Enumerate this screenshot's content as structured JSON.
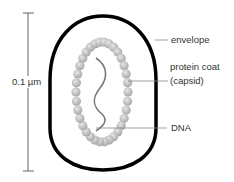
{
  "diagram": {
    "scale_bar": {
      "label": "0.1 µm"
    },
    "labels": {
      "envelope": "envelope",
      "protein_coat_line1": "protein coat",
      "protein_coat_line2": "(capsid)",
      "dna": "DNA"
    },
    "colors": {
      "envelope": "#000000",
      "capsid_bead": "#b8b8b8",
      "dna": "#777777",
      "leader_line": "#888888",
      "text": "#333333"
    }
  }
}
